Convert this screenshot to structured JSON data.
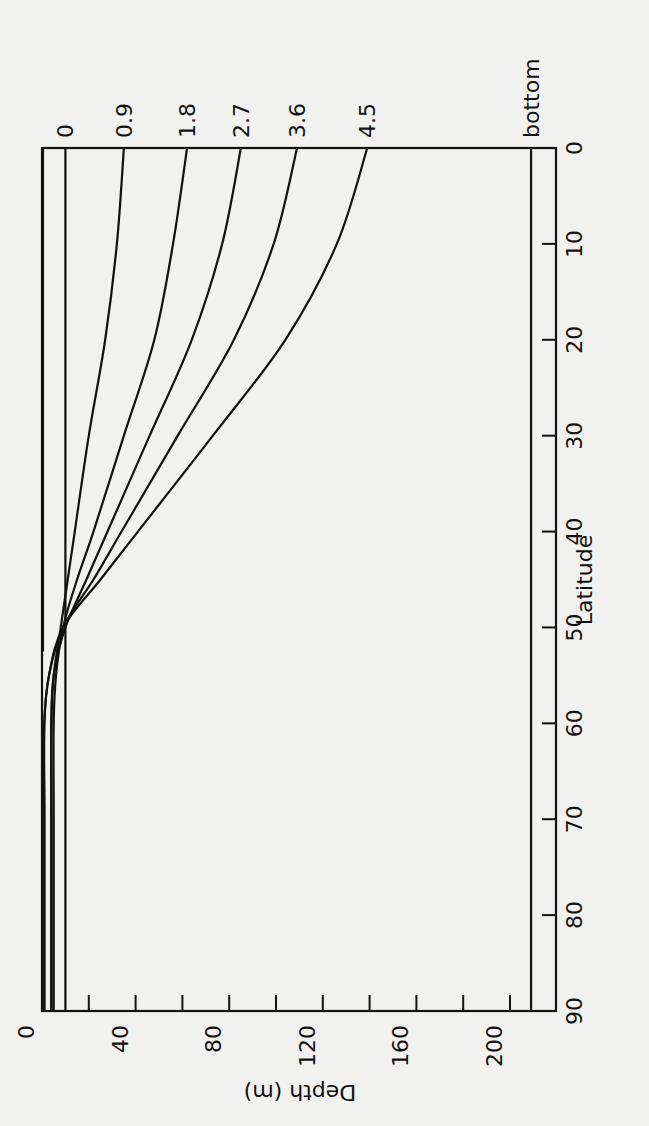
{
  "chart_data": {
    "type": "line",
    "orientation": "rotated-90",
    "title": "",
    "xlabel": "Latitude",
    "ylabel": "Depth (m)",
    "x_axis": {
      "label": "Latitude",
      "ticks": [
        0,
        10,
        20,
        30,
        40,
        50,
        60,
        70,
        80,
        90
      ],
      "range": [
        0,
        90
      ]
    },
    "y_axis": {
      "label": "Depth (m)",
      "ticks": [
        0,
        40,
        80,
        120,
        160,
        200
      ],
      "minor_ticks": [
        20,
        60,
        100,
        140,
        180
      ],
      "range": [
        0,
        215
      ],
      "inverted": true
    },
    "grid": false,
    "legend": "inline labels at top of curves",
    "x": [
      0,
      10,
      20,
      30,
      40,
      45,
      50,
      55,
      60,
      70,
      80,
      90
    ],
    "series": [
      {
        "name": "0",
        "values": [
          10,
          10,
          10,
          10,
          10,
          10,
          10,
          10,
          10,
          10,
          10,
          10
        ]
      },
      {
        "name": "0.9",
        "values": [
          35,
          32,
          27,
          20,
          14,
          11,
          8,
          5,
          4,
          4,
          4,
          4
        ]
      },
      {
        "name": "1.8",
        "values": [
          62,
          56,
          48,
          35,
          22,
          15,
          9,
          6,
          5,
          5,
          5,
          5
        ]
      },
      {
        "name": "2.7",
        "values": [
          85,
          77,
          64,
          46,
          28,
          19,
          10,
          5,
          4,
          4,
          4,
          4
        ]
      },
      {
        "name": "3.6",
        "values": [
          109,
          99,
          82,
          58,
          34,
          22,
          9,
          3,
          1,
          1,
          1,
          1
        ]
      },
      {
        "name": "4.5",
        "values": [
          139,
          126,
          104,
          73,
          41,
          25,
          9,
          3,
          1,
          1,
          1,
          1
        ]
      },
      {
        "name": "bottom",
        "values": [
          209,
          209,
          209,
          209,
          209,
          209,
          209,
          209,
          209,
          209,
          209,
          209
        ]
      }
    ],
    "annotations": [
      {
        "text": "vertical line at depth 0 from latitude 0 to ~52",
        "type": "reference"
      }
    ]
  },
  "labels": {
    "series": [
      "0",
      "0.9",
      "1.8",
      "2.7",
      "3.6",
      "4.5",
      "bottom"
    ],
    "depth_ticks": [
      "0",
      "40",
      "80",
      "120",
      "160",
      "200"
    ],
    "lat_ticks": [
      "0",
      "10",
      "20",
      "30",
      "40",
      "50",
      "60",
      "70",
      "80",
      "90"
    ],
    "xlabel": "Latitude",
    "ylabel": "Depth (m)"
  }
}
